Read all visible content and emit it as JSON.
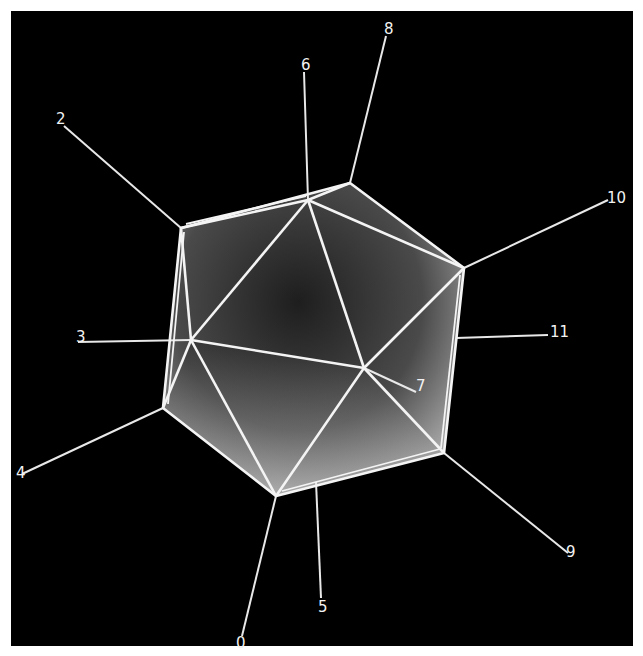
{
  "figure": {
    "background_color": "#000000",
    "edge_color": "#f4f4f4",
    "face_shading": [
      "#3a3a3a",
      "#bdbdbd"
    ],
    "vertex_count": 12
  },
  "vertices": [
    {
      "id": "0",
      "label": "0",
      "pos": [
        276,
        496
      ],
      "label_end": [
        242,
        636
      ],
      "text_pos": [
        236,
        650
      ]
    },
    {
      "id": "2",
      "label": "2",
      "pos": [
        181,
        228
      ],
      "label_end": [
        64,
        126
      ],
      "text_pos": [
        56,
        122
      ]
    },
    {
      "id": "3",
      "label": "3",
      "pos": [
        191,
        340
      ],
      "label_end": [
        78,
        342
      ],
      "text_pos": [
        76,
        340
      ]
    },
    {
      "id": "4",
      "label": "4",
      "pos": [
        163,
        408
      ],
      "label_end": [
        22,
        474
      ],
      "text_pos": [
        16,
        478
      ]
    },
    {
      "id": "5",
      "label": "5",
      "pos": [
        316,
        482
      ],
      "label_end": [
        321,
        598
      ],
      "text_pos": [
        318,
        612
      ]
    },
    {
      "id": "6",
      "label": "6",
      "pos": [
        308,
        200
      ],
      "label_end": [
        304,
        72
      ],
      "text_pos": [
        301,
        68
      ]
    },
    {
      "id": "7",
      "label": "7",
      "pos": [
        364,
        368
      ],
      "label_end": [
        416,
        392
      ],
      "text_pos": [
        416,
        391
      ]
    },
    {
      "id": "8",
      "label": "8",
      "pos": [
        350,
        183
      ],
      "label_end": [
        386,
        36
      ],
      "text_pos": [
        384,
        34
      ]
    },
    {
      "id": "9",
      "label": "9",
      "pos": [
        444,
        453
      ],
      "label_end": [
        568,
        553
      ],
      "text_pos": [
        566,
        558
      ]
    },
    {
      "id": "10",
      "label": "10",
      "pos": [
        464,
        268
      ],
      "label_end": [
        608,
        200
      ],
      "text_pos": [
        607,
        203
      ]
    },
    {
      "id": "11",
      "label": "11",
      "pos": [
        456,
        338
      ],
      "label_end": [
        548,
        335
      ],
      "text_pos": [
        550,
        336
      ]
    }
  ]
}
